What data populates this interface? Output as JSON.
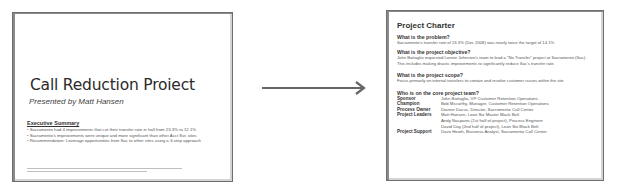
{
  "slides": {
    "left": {
      "title": "Call Reduction Proiect",
      "subtitle": "Presented by Matt Hansen",
      "executive_summary": {
        "heading": "Executive Summary",
        "items": [
          "• Sacramento had 4 improvements that cut their transfer rate in half from 23.3% to 12.1%",
          "• Sacramento's improvements were unique and more significant than other Acct Svc sites",
          "• Recommendation: Leverage opportunities from Sac to other sites using a 3-step approach"
        ]
      }
    },
    "right": {
      "title": "Project Charter",
      "sections": [
        {
          "question": "What is the problem?",
          "answer": [
            "Sacramento's transfer rate of 23.3% (Dec 2008) was nearly twice the target of 14.1%"
          ]
        },
        {
          "question": "What is the project objective?",
          "answer": [
            "John Battaglia requested Lonnie Johnston's team to lead a \"No Transfer\" project at Sacramento (Sac).",
            "This includes making drastic improvements to significantly reduce Sac's transfer rate."
          ]
        },
        {
          "question": "What is the project scope?",
          "answer": [
            "Focus primarily on internal transfers to contain and resolve customer issues within the site"
          ]
        }
      ],
      "team": {
        "question": "Who is on the core project team?",
        "rows": [
          {
            "role": "Sponsor",
            "who": "John Battaglia, VP Customer Retention Operations"
          },
          {
            "role": "Champion",
            "who": "Bob Mccarthy, Manager, Customer Retention Operations"
          },
          {
            "role": "Process Owner",
            "who": "Dianne Dacus, Director, Sacramento Call Center"
          },
          {
            "role": "Project Leaders",
            "who": "Matt Hansen, Lean Six Master Black Belt"
          },
          {
            "role": "",
            "who": "Andy Nacpanis (1st half of project), Process Engineer"
          },
          {
            "role": "",
            "who": "David Day (2nd half of project), Lean Six Black Belt"
          },
          {
            "role": "Project Support",
            "who": "Dave Heath, Business Analyst, Sacramento Call Center"
          }
        ]
      }
    }
  },
  "connector": {
    "icon": "arrow-right-icon",
    "color": "#666666"
  }
}
